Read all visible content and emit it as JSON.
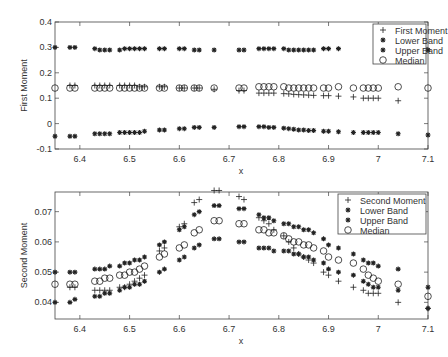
{
  "chart_data": [
    {
      "type": "scatter",
      "title": "",
      "xlabel": "x",
      "ylabel": "First Moment",
      "xlim": [
        6.35,
        7.1
      ],
      "ylim": [
        -0.1,
        0.4
      ],
      "xticks": [
        "6.4",
        "6.5",
        "6.6",
        "6.7",
        "6.8",
        "6.9",
        "7",
        "7.1"
      ],
      "yticks": [
        "-0.1",
        "0",
        "0.1",
        "0.2",
        "0.3",
        "0.4"
      ],
      "grid": false,
      "legend_position": "upper right",
      "series": [
        {
          "name": "First Moment",
          "marker": "+",
          "x": [
            6.38,
            6.39,
            6.43,
            6.44,
            6.45,
            6.46,
            6.48,
            6.49,
            6.5,
            6.51,
            6.52,
            6.53,
            6.56,
            6.57,
            6.6,
            6.61,
            6.63,
            6.64,
            6.67,
            6.72,
            6.73,
            6.76,
            6.77,
            6.78,
            6.79,
            6.81,
            6.82,
            6.83,
            6.84,
            6.85,
            6.86,
            6.87,
            6.89,
            6.9,
            6.92,
            6.95,
            6.97,
            6.98,
            6.99,
            7.0,
            7.04
          ],
          "y": [
            0.15,
            0.15,
            0.15,
            0.15,
            0.15,
            0.15,
            0.15,
            0.15,
            0.15,
            0.15,
            0.145,
            0.145,
            0.145,
            0.145,
            0.14,
            0.14,
            0.14,
            0.14,
            0.135,
            0.13,
            0.13,
            0.12,
            0.12,
            0.12,
            0.12,
            0.118,
            0.117,
            0.115,
            0.114,
            0.113,
            0.112,
            0.111,
            0.11,
            0.11,
            0.108,
            0.105,
            0.1,
            0.1,
            0.1,
            0.1,
            0.09
          ]
        },
        {
          "name": "Lower Band",
          "marker": "*",
          "x": [
            6.35,
            6.38,
            6.39,
            6.43,
            6.44,
            6.45,
            6.46,
            6.48,
            6.49,
            6.5,
            6.51,
            6.52,
            6.53,
            6.56,
            6.57,
            6.6,
            6.61,
            6.63,
            6.64,
            6.67,
            6.72,
            6.73,
            6.76,
            6.77,
            6.78,
            6.79,
            6.81,
            6.82,
            6.83,
            6.84,
            6.85,
            6.86,
            6.87,
            6.89,
            6.9,
            6.92,
            6.95,
            6.97,
            6.98,
            6.99,
            7.0,
            7.04,
            7.1
          ],
          "y": [
            -0.05,
            -0.05,
            -0.05,
            -0.04,
            -0.04,
            -0.04,
            -0.04,
            -0.035,
            -0.035,
            -0.035,
            -0.035,
            -0.035,
            -0.03,
            -0.025,
            -0.025,
            -0.02,
            -0.02,
            -0.015,
            -0.015,
            -0.015,
            -0.012,
            -0.012,
            -0.012,
            -0.012,
            -0.015,
            -0.015,
            -0.018,
            -0.02,
            -0.022,
            -0.025,
            -0.025,
            -0.027,
            -0.027,
            -0.03,
            -0.03,
            -0.032,
            -0.035,
            -0.035,
            -0.035,
            -0.035,
            -0.035,
            -0.04,
            -0.045
          ]
        },
        {
          "name": "Upper Band",
          "marker": "*",
          "x": [
            6.35,
            6.38,
            6.39,
            6.43,
            6.44,
            6.45,
            6.46,
            6.48,
            6.49,
            6.5,
            6.51,
            6.52,
            6.53,
            6.56,
            6.57,
            6.6,
            6.61,
            6.63,
            6.64,
            6.67,
            6.72,
            6.73,
            6.76,
            6.77,
            6.78,
            6.79,
            6.81,
            6.82,
            6.83,
            6.84,
            6.85,
            6.86,
            6.87,
            6.89,
            6.9,
            6.92,
            7.1
          ],
          "y": [
            0.3,
            0.3,
            0.3,
            0.295,
            0.29,
            0.29,
            0.29,
            0.29,
            0.295,
            0.295,
            0.295,
            0.295,
            0.295,
            0.295,
            0.295,
            0.295,
            0.295,
            0.29,
            0.29,
            0.29,
            0.29,
            0.29,
            0.295,
            0.295,
            0.295,
            0.295,
            0.295,
            0.29,
            0.29,
            0.29,
            0.29,
            0.29,
            0.29,
            0.295,
            0.295,
            0.295,
            0.29
          ]
        },
        {
          "name": "Median",
          "marker": "o",
          "x": [
            6.35,
            6.38,
            6.39,
            6.43,
            6.44,
            6.45,
            6.46,
            6.48,
            6.49,
            6.5,
            6.51,
            6.52,
            6.53,
            6.56,
            6.57,
            6.6,
            6.61,
            6.63,
            6.64,
            6.67,
            6.72,
            6.73,
            6.76,
            6.77,
            6.78,
            6.79,
            6.81,
            6.82,
            6.83,
            6.84,
            6.85,
            6.86,
            6.87,
            6.89,
            6.9,
            6.92,
            6.95,
            6.97,
            6.98,
            6.99,
            7.0,
            7.04,
            7.1
          ],
          "y": [
            0.14,
            0.14,
            0.14,
            0.14,
            0.14,
            0.14,
            0.14,
            0.14,
            0.14,
            0.14,
            0.14,
            0.14,
            0.14,
            0.14,
            0.14,
            0.14,
            0.14,
            0.14,
            0.14,
            0.14,
            0.14,
            0.14,
            0.145,
            0.145,
            0.145,
            0.145,
            0.145,
            0.14,
            0.14,
            0.14,
            0.14,
            0.14,
            0.14,
            0.14,
            0.14,
            0.145,
            0.14,
            0.14,
            0.14,
            0.14,
            0.14,
            0.145,
            0.14
          ]
        }
      ]
    },
    {
      "type": "scatter",
      "title": "",
      "xlabel": "x",
      "ylabel": "Second Moment",
      "xlim": [
        6.35,
        7.1
      ],
      "ylim": [
        0.0345,
        0.0765
      ],
      "xticks": [
        "6.4",
        "6.5",
        "6.6",
        "6.7",
        "6.8",
        "6.9",
        "7",
        "7.1"
      ],
      "yticks": [
        "0.04",
        "0.05",
        "0.06",
        "0.07"
      ],
      "grid": false,
      "legend_position": "upper right",
      "series": [
        {
          "name": "Second Moment",
          "marker": "+",
          "x": [
            6.38,
            6.39,
            6.43,
            6.44,
            6.45,
            6.46,
            6.48,
            6.49,
            6.5,
            6.51,
            6.52,
            6.53,
            6.56,
            6.57,
            6.6,
            6.61,
            6.63,
            6.64,
            6.67,
            6.68,
            6.72,
            6.73,
            6.76,
            6.77,
            6.78,
            6.79,
            6.81,
            6.82,
            6.83,
            6.84,
            6.85,
            6.86,
            6.87,
            6.89,
            6.9,
            6.92,
            6.95,
            6.97,
            6.98,
            6.99,
            7.0,
            7.04,
            7.1
          ],
          "y": [
            0.045,
            0.045,
            0.044,
            0.044,
            0.044,
            0.044,
            0.045,
            0.045,
            0.046,
            0.047,
            0.048,
            0.049,
            0.057,
            0.058,
            0.065,
            0.066,
            0.073,
            0.074,
            0.077,
            0.077,
            0.075,
            0.074,
            0.068,
            0.067,
            0.066,
            0.064,
            0.062,
            0.06,
            0.058,
            0.056,
            0.055,
            0.054,
            0.053,
            0.05,
            0.049,
            0.047,
            0.045,
            0.044,
            0.043,
            0.043,
            0.043,
            0.04,
            0.038
          ]
        },
        {
          "name": "Lower Band",
          "marker": "*",
          "x": [
            6.35,
            6.38,
            6.39,
            6.43,
            6.44,
            6.45,
            6.46,
            6.48,
            6.49,
            6.5,
            6.51,
            6.52,
            6.53,
            6.56,
            6.57,
            6.6,
            6.61,
            6.63,
            6.64,
            6.67,
            6.68,
            6.72,
            6.73,
            6.76,
            6.77,
            6.78,
            6.79,
            6.81,
            6.82,
            6.83,
            6.84,
            6.85,
            6.86,
            6.87,
            6.89,
            6.9,
            6.92,
            6.95,
            6.97,
            6.98,
            6.99,
            7.0,
            7.04,
            7.1
          ],
          "y": [
            0.04,
            0.04,
            0.041,
            0.042,
            0.042,
            0.043,
            0.043,
            0.044,
            0.045,
            0.045,
            0.046,
            0.046,
            0.047,
            0.05,
            0.051,
            0.054,
            0.055,
            0.058,
            0.059,
            0.061,
            0.061,
            0.06,
            0.06,
            0.058,
            0.058,
            0.058,
            0.057,
            0.057,
            0.057,
            0.056,
            0.056,
            0.055,
            0.055,
            0.054,
            0.053,
            0.051,
            0.05,
            0.049,
            0.047,
            0.046,
            0.045,
            0.045,
            0.044,
            0.038,
            0.035
          ]
        },
        {
          "name": "Upper Band",
          "marker": "*",
          "x": [
            6.35,
            6.38,
            6.39,
            6.43,
            6.44,
            6.45,
            6.46,
            6.48,
            6.49,
            6.5,
            6.51,
            6.52,
            6.53,
            6.56,
            6.57,
            6.6,
            6.61,
            6.63,
            6.64,
            6.67,
            6.68,
            6.72,
            6.73,
            6.76,
            6.77,
            6.78,
            6.79,
            6.81,
            6.82,
            6.83,
            6.84,
            6.85,
            6.86,
            6.87,
            6.89,
            6.9,
            6.92,
            6.95,
            6.97,
            6.98,
            6.99,
            7.0,
            7.04,
            7.1
          ],
          "y": [
            0.05,
            0.05,
            0.05,
            0.051,
            0.051,
            0.051,
            0.052,
            0.052,
            0.053,
            0.053,
            0.054,
            0.054,
            0.055,
            0.059,
            0.06,
            0.064,
            0.065,
            0.069,
            0.07,
            0.072,
            0.072,
            0.071,
            0.071,
            0.069,
            0.068,
            0.068,
            0.067,
            0.066,
            0.066,
            0.065,
            0.065,
            0.064,
            0.064,
            0.063,
            0.061,
            0.059,
            0.058,
            0.056,
            0.054,
            0.053,
            0.053,
            0.052,
            0.051,
            0.045
          ]
        },
        {
          "name": "Median",
          "marker": "o",
          "x": [
            6.35,
            6.38,
            6.39,
            6.43,
            6.44,
            6.45,
            6.46,
            6.48,
            6.49,
            6.5,
            6.51,
            6.52,
            6.53,
            6.56,
            6.57,
            6.6,
            6.61,
            6.63,
            6.64,
            6.67,
            6.68,
            6.72,
            6.73,
            6.76,
            6.77,
            6.78,
            6.79,
            6.81,
            6.82,
            6.83,
            6.84,
            6.85,
            6.86,
            6.87,
            6.89,
            6.9,
            6.92,
            6.95,
            6.97,
            6.98,
            6.99,
            7.0,
            7.04,
            7.1
          ],
          "y": [
            0.046,
            0.046,
            0.046,
            0.047,
            0.047,
            0.048,
            0.048,
            0.049,
            0.049,
            0.05,
            0.05,
            0.051,
            0.052,
            0.055,
            0.056,
            0.058,
            0.059,
            0.063,
            0.064,
            0.067,
            0.067,
            0.066,
            0.066,
            0.064,
            0.064,
            0.063,
            0.063,
            0.062,
            0.061,
            0.06,
            0.06,
            0.059,
            0.059,
            0.058,
            0.057,
            0.055,
            0.054,
            0.053,
            0.051,
            0.049,
            0.048,
            0.047,
            0.046,
            0.042,
            0.041
          ]
        }
      ]
    }
  ]
}
